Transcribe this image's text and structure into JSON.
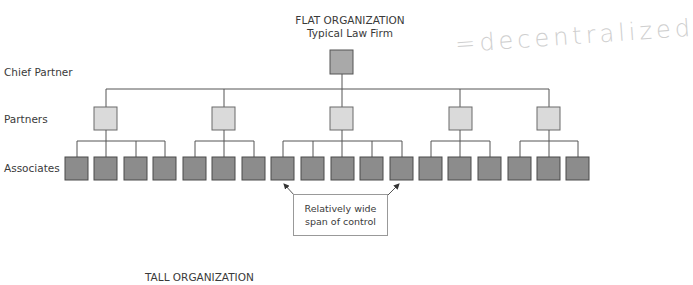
{
  "flat": {
    "title": "FLAT ORGANIZATION",
    "subtitle": "Typical Law Firm"
  },
  "levels": {
    "chief": "Chief Partner",
    "partners": "Partners",
    "associates": "Associates"
  },
  "callout": {
    "line1": "Relatively wide",
    "line2": "span of control"
  },
  "annotation": "=decentralized",
  "tall": {
    "title": "TALL ORGANIZATION"
  },
  "structure": {
    "chief_count": 1,
    "partner_count": 5,
    "associates_per_partner": [
      4,
      3,
      5,
      3,
      3
    ]
  },
  "colors": {
    "chief_fill": "#a9a9a9",
    "partner_fill": "#dadada",
    "associate_fill": "#8c8c8c",
    "line": "#555555"
  }
}
